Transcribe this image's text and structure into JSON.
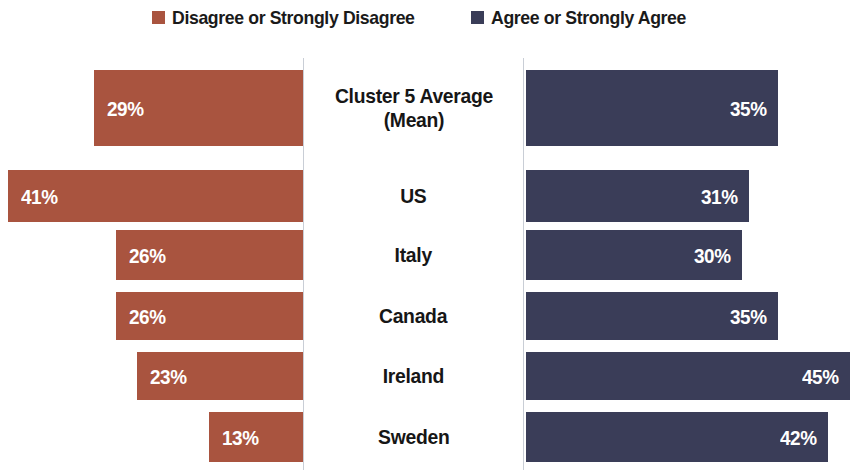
{
  "legend": {
    "items": [
      {
        "label": "Disagree or Strongly Disagree",
        "color": "#a9543f",
        "icon": "square-swatch-icon"
      },
      {
        "label": "Agree or Strongly Agree",
        "color": "#3a3d58",
        "icon": "square-swatch-icon"
      }
    ]
  },
  "rows": [
    {
      "label": "Cluster 5 Average\n(Mean)",
      "left_value": "29%",
      "right_value": "35%",
      "left_pct": 29,
      "right_pct": 35,
      "tall": true
    },
    {
      "label": "US",
      "left_value": "41%",
      "right_value": "31%",
      "left_pct": 41,
      "right_pct": 31,
      "tall": false
    },
    {
      "label": "Italy",
      "left_value": "26%",
      "right_value": "30%",
      "left_pct": 26,
      "right_pct": 30,
      "tall": false
    },
    {
      "label": "Canada",
      "left_value": "26%",
      "right_value": "35%",
      "left_pct": 26,
      "right_pct": 35,
      "tall": false
    },
    {
      "label": "Ireland",
      "left_value": "23%",
      "right_value": "45%",
      "left_pct": 23,
      "right_pct": 45,
      "tall": false
    },
    {
      "label": "Sweden",
      "left_value": "13%",
      "right_value": "42%",
      "left_pct": 13,
      "right_pct": 42,
      "tall": false
    }
  ],
  "chart_data": {
    "type": "bar",
    "orientation": "horizontal",
    "subtype": "diverging-butterfly",
    "title": "",
    "xlabel": "",
    "ylabel": "",
    "categories": [
      "Cluster 5 Average (Mean)",
      "US",
      "Italy",
      "Canada",
      "Ireland",
      "Sweden"
    ],
    "series": [
      {
        "name": "Disagree or Strongly Disagree",
        "color": "#a9543f",
        "direction": "left",
        "values": [
          29,
          41,
          26,
          26,
          23,
          13
        ],
        "value_labels": [
          "29%",
          "41%",
          "26%",
          "26%",
          "23%",
          "13%"
        ]
      },
      {
        "name": "Agree or Strongly Agree",
        "color": "#3a3d58",
        "direction": "right",
        "values": [
          35,
          31,
          30,
          35,
          45,
          42
        ],
        "value_labels": [
          "35%",
          "31%",
          "30%",
          "35%",
          "45%",
          "42%"
        ]
      }
    ],
    "units": "percent",
    "xlim": [
      0,
      45
    ],
    "grid": false,
    "axis_lines": "vertical baseline at each side of centered category column",
    "legend_position": "top-center",
    "data_labels": true
  }
}
